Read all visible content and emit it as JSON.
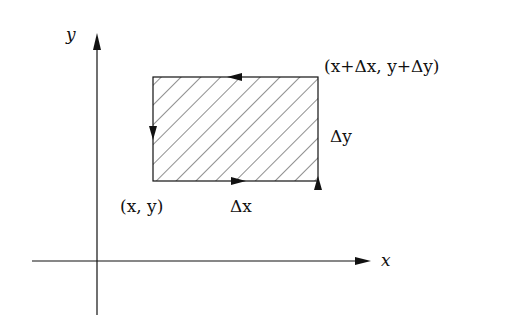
{
  "diagram": {
    "axes": {
      "x_label": "x",
      "y_label": "y"
    },
    "rectangle": {
      "fill": "hatched",
      "corner_lower_left_label": "(x, y)",
      "corner_upper_right_label": "(x+Δx, y+Δy)",
      "bottom_edge_label": "Δx",
      "right_edge_label": "Δy",
      "circulation": "counterclockwise"
    },
    "colors": {
      "stroke": "#111111",
      "background": "#ffffff"
    }
  }
}
